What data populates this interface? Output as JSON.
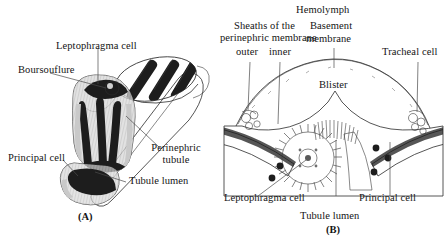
{
  "figure": {
    "style": "grayscale line engraving",
    "background_color": "#ffffff",
    "ink_color": "#1d1d1d"
  },
  "panel_a": {
    "tag": "(A)",
    "labels": {
      "leptophragma_cell": "Leptophragma cell",
      "boursouflure": "Boursouflure",
      "principal_cell": "Principal cell",
      "perinephric_tubule": "Perinephric tubule",
      "tubule_lumen": "Tubule lumen"
    }
  },
  "panel_b": {
    "tag": "(B)",
    "labels": {
      "hemolymph": "Hemolymph",
      "sheaths_line1": "Sheaths of the",
      "sheaths_line2": "perinephric membrane",
      "sheath_outer": "outer",
      "sheath_inner": "inner",
      "basement_membrane_line1": "Basement",
      "basement_membrane_line2": "membrane",
      "tracheal_cell": "Tracheal cell",
      "blister": "Blister",
      "leptophragma_cell": "Leptophragma cell",
      "principal_cell": "Principal cell",
      "tubule_lumen": "Tubule lumen"
    }
  }
}
